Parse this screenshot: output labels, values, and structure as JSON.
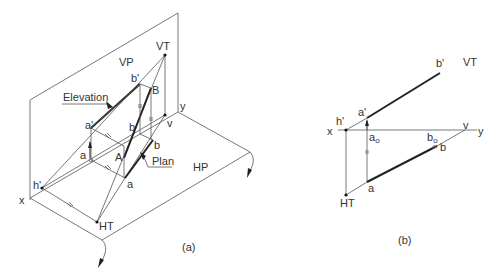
{
  "figure_a": {
    "caption": "(a)",
    "labels": {
      "vp": "VP",
      "hp": "HP",
      "vt": "VT",
      "x": "x",
      "y": "y",
      "v": "v",
      "h_prime": "h'",
      "ht": "HT",
      "a_prime": "a'",
      "b_prime": "b'",
      "a0": "a",
      "a0_sub": "o",
      "b0": "b",
      "b0_sub": "o",
      "a": "a",
      "b": "b",
      "A": "A",
      "B": "B",
      "elevation": "Elevation",
      "plan": "Plan"
    }
  },
  "figure_b": {
    "caption": "(b)",
    "labels": {
      "vt": "VT",
      "x": "x",
      "y": "y",
      "v": "v",
      "h_prime": "h'",
      "ht": "HT",
      "a_prime": "a'",
      "b_prime": "b'",
      "a0": "a",
      "a0_sub": "o",
      "b0": "b",
      "b0_sub": "o",
      "a": "a",
      "b": "b"
    }
  }
}
